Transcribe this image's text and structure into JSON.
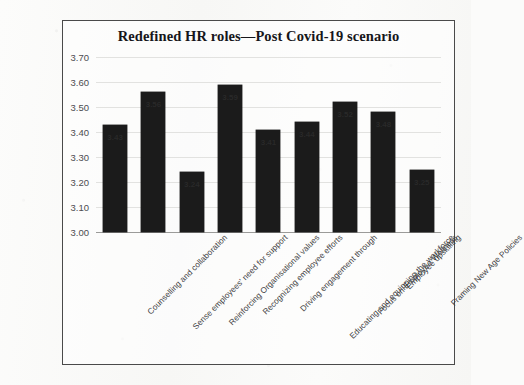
{
  "chart_data": {
    "type": "bar",
    "title": "Redefined HR roles—Post Covid-19 scenario",
    "xlabel": "",
    "ylabel": "",
    "ylim": [
      3.0,
      3.7
    ],
    "ytick_step": 0.1,
    "yticks": [
      "3.70",
      "3.60",
      "3.50",
      "3.40",
      "3.30",
      "3.20",
      "3.10",
      "3.00"
    ],
    "grid": true,
    "legend": false,
    "bar_color": "#1b1b1b",
    "data_labels": true,
    "categories": [
      "Counselling and collaboration",
      "Sense employees' need for support",
      "Reinforcing Organisational values",
      "Recognizing employee efforts",
      "Driving engagement through",
      "Educating and equipping the workforce",
      "Focus on Employee Wellness",
      "Employee upskilling",
      "Framing New Age Policies"
    ],
    "values": [
      3.43,
      3.56,
      3.24,
      3.59,
      3.41,
      3.44,
      3.52,
      3.48,
      3.25
    ],
    "value_labels": [
      "3.43",
      "3.56",
      "3.24",
      "3.59",
      "3.41",
      "3.44",
      "3.52",
      "3.48",
      "3.25"
    ]
  }
}
